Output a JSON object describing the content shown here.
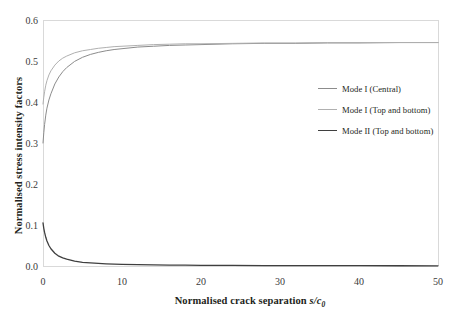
{
  "chart_data": {
    "type": "line",
    "title": "",
    "xlabel": "Normalised crack separation s/c0",
    "xlabel_main": "Normalised crack separation ",
    "xlabel_var": "s/c",
    "xlabel_sub": "0",
    "ylabel": "Normalised stress intensity factors",
    "xlim": [
      0,
      50
    ],
    "ylim": [
      0,
      0.6
    ],
    "xticks": [
      0,
      10,
      20,
      30,
      40,
      50
    ],
    "xtick_labels": [
      "0",
      "10",
      "20",
      "30",
      "40",
      "50"
    ],
    "yticks": [
      0.0,
      0.1,
      0.2,
      0.3,
      0.4,
      0.5,
      0.6
    ],
    "ytick_labels": [
      "0.0",
      "0.1",
      "0.2",
      "0.3",
      "0.4",
      "0.5",
      "0.6"
    ],
    "grid": false,
    "legend_position": "center-right",
    "series": [
      {
        "name": "Mode I (Central)",
        "color": "#8c8c8c",
        "width": 1.0,
        "x": [
          0,
          0.1,
          0.2,
          0.35,
          0.5,
          0.75,
          1,
          1.5,
          2,
          2.5,
          3,
          4,
          5,
          6,
          7,
          8,
          9,
          10,
          12,
          14,
          16,
          18,
          20,
          24,
          28,
          32,
          36,
          40,
          45,
          50
        ],
        "y": [
          0.3,
          0.325,
          0.345,
          0.368,
          0.385,
          0.405,
          0.42,
          0.444,
          0.461,
          0.474,
          0.484,
          0.499,
          0.509,
          0.516,
          0.521,
          0.525,
          0.528,
          0.53,
          0.534,
          0.536,
          0.538,
          0.539,
          0.54,
          0.542,
          0.543,
          0.543,
          0.544,
          0.544,
          0.545,
          0.545
        ]
      },
      {
        "name": "Mode I (Top and bottom)",
        "color": "#b0b0b0",
        "width": 1.0,
        "x": [
          0,
          0.1,
          0.2,
          0.35,
          0.5,
          0.75,
          1,
          1.5,
          2,
          2.5,
          3,
          4,
          5,
          6,
          7,
          8,
          9,
          10,
          12,
          14,
          16,
          18,
          20,
          24,
          28,
          32,
          36,
          40,
          45,
          50
        ],
        "y": [
          0.395,
          0.412,
          0.425,
          0.441,
          0.452,
          0.466,
          0.476,
          0.49,
          0.5,
          0.507,
          0.512,
          0.52,
          0.525,
          0.528,
          0.531,
          0.533,
          0.535,
          0.536,
          0.538,
          0.54,
          0.541,
          0.542,
          0.542,
          0.543,
          0.544,
          0.544,
          0.545,
          0.545,
          0.545,
          0.545
        ]
      },
      {
        "name": "Mode II (Top and bottom)",
        "color": "#3f3f3f",
        "width": 1.3,
        "x": [
          0,
          0.1,
          0.2,
          0.35,
          0.5,
          0.75,
          1,
          1.5,
          2,
          2.5,
          3,
          4,
          5,
          6,
          7,
          8,
          9,
          10,
          12,
          14,
          16,
          18,
          20,
          24,
          28,
          32,
          36,
          40,
          45,
          50
        ],
        "y": [
          0.105,
          0.092,
          0.082,
          0.07,
          0.061,
          0.05,
          0.042,
          0.031,
          0.024,
          0.02,
          0.017,
          0.012,
          0.009,
          0.0075,
          0.0062,
          0.0053,
          0.0046,
          0.004,
          0.0032,
          0.0026,
          0.0022,
          0.0019,
          0.0017,
          0.0013,
          0.0011,
          0.0009,
          0.0008,
          0.0007,
          0.0006,
          0.0005
        ]
      }
    ]
  },
  "legend": {
    "items": [
      {
        "label": "Mode I (Central)",
        "color": "#8c8c8c",
        "thickness": "1px"
      },
      {
        "label": "Mode I (Top and bottom)",
        "color": "#b0b0b0",
        "thickness": "1px"
      },
      {
        "label": "Mode II (Top and bottom)",
        "color": "#3f3f3f",
        "thickness": "1.6px"
      }
    ]
  },
  "axes": {
    "frame_color": "#d9d9d9",
    "tick_color": "#3a3a3a"
  }
}
